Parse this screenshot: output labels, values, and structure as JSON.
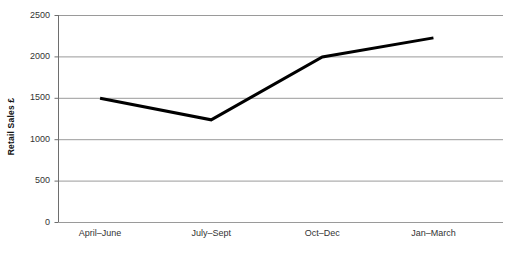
{
  "chart_data": {
    "type": "line",
    "title": "",
    "subtitle": "",
    "xlabel": "",
    "ylabel": "Retail Sales £",
    "categories": [
      "April–June",
      "July–Sept",
      "Oct–Dec",
      "Jan–March"
    ],
    "values": [
      1500,
      1240,
      2000,
      2230
    ],
    "series": [
      {
        "name": "Retail Sales",
        "values": [
          1500,
          1240,
          2000,
          2230
        ],
        "color": "#000000"
      }
    ],
    "ylim": [
      0,
      2500
    ],
    "yticks": [
      0,
      500,
      1000,
      1500,
      2000,
      2500
    ],
    "ytick_labels": [
      "0",
      "500",
      "1000",
      "1500",
      "2000",
      "2500"
    ],
    "grid": true,
    "grid_axis": "y",
    "grid_color": "#9a9a9a",
    "axis_color": "#6e6e6e",
    "line_color": "#000000",
    "line_width": 3,
    "markers": false,
    "legend": false,
    "legend_position": "none",
    "background": "#ffffff",
    "annotations": []
  }
}
